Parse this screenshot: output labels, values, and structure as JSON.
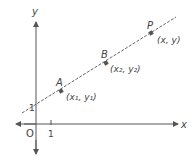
{
  "diagram": {
    "axes": {
      "x_label": "x",
      "y_label": "y",
      "origin_label": "O",
      "x_tick_label": "1",
      "y_intercept_label": "1"
    },
    "line": {
      "style": "dashed",
      "color": "#555555"
    },
    "points": [
      {
        "name": "A",
        "coords": "(x₁, y₁)"
      },
      {
        "name": "B",
        "coords": "(x₂, y₂)"
      },
      {
        "name": "P",
        "coords": "(x, y)"
      }
    ],
    "colors": {
      "axis": "#555555",
      "point": "#555555",
      "text": "#444444"
    }
  }
}
